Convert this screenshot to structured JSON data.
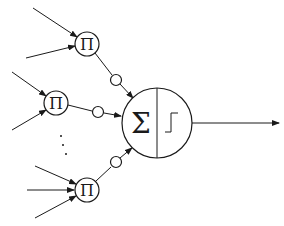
{
  "diagram": {
    "title": "",
    "product_nodes": [
      {
        "id": "pi-top",
        "label": "Π"
      },
      {
        "id": "pi-middle",
        "label": "Π"
      },
      {
        "id": "pi-bottom",
        "label": "Π"
      }
    ],
    "ellipsis": "⋮",
    "neuron": {
      "sum_label": "Σ",
      "activation": "step function"
    },
    "colors": {
      "stroke": "#1a1a1a",
      "background": "#ffffff"
    }
  }
}
